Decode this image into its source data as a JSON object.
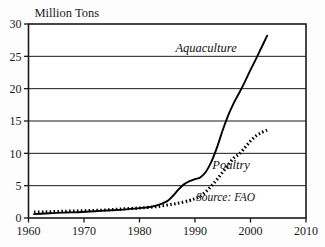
{
  "chart_data": {
    "type": "line",
    "title": "",
    "xlabel": "",
    "ylabel": "Million Tons",
    "xlim": [
      1960,
      2010
    ],
    "ylim": [
      0,
      30
    ],
    "xticks": [
      1960,
      1970,
      1980,
      1990,
      2000,
      2010
    ],
    "yticks": [
      0,
      5,
      10,
      15,
      20,
      25,
      30
    ],
    "grid": "horizontal",
    "legend_position": "inline-annotations",
    "annotations": [
      {
        "text": "Aquaculture",
        "x": 1992,
        "y": 25.6,
        "style": "italic"
      },
      {
        "text": "Poultry",
        "x": 1996.5,
        "y": 7.6,
        "style": "italic"
      },
      {
        "text": "Source: FAO",
        "x": 1995.5,
        "y": 2.6,
        "style": "italic"
      }
    ],
    "series": [
      {
        "name": "Aquaculture",
        "style": "solid",
        "color": "#000000",
        "x": [
          1961,
          1963,
          1965,
          1967,
          1969,
          1971,
          1973,
          1975,
          1977,
          1979,
          1981,
          1983,
          1985,
          1986,
          1987,
          1988,
          1989,
          1990,
          1991,
          1992,
          1993,
          1994,
          1995,
          1996,
          1997,
          1998,
          1999,
          2000,
          2001,
          2002,
          2003
        ],
        "values": [
          0.6,
          0.7,
          0.8,
          0.85,
          0.9,
          1.0,
          1.1,
          1.2,
          1.3,
          1.45,
          1.6,
          1.9,
          2.6,
          3.4,
          4.4,
          5.2,
          5.7,
          6.0,
          6.3,
          7.2,
          8.8,
          11.0,
          13.6,
          15.9,
          17.8,
          19.4,
          21.1,
          22.9,
          24.6,
          26.4,
          28.2
        ]
      },
      {
        "name": "Poultry",
        "style": "dotted",
        "color": "#000000",
        "x": [
          1961,
          1963,
          1965,
          1967,
          1969,
          1971,
          1973,
          1975,
          1977,
          1979,
          1981,
          1983,
          1985,
          1987,
          1989,
          1990,
          1991,
          1992,
          1993,
          1994,
          1995,
          1996,
          1997,
          1998,
          1999,
          2000,
          2001,
          2002,
          2003
        ],
        "values": [
          0.9,
          0.95,
          1.0,
          1.05,
          1.1,
          1.15,
          1.2,
          1.3,
          1.4,
          1.5,
          1.6,
          1.75,
          2.0,
          2.3,
          2.7,
          3.0,
          3.4,
          4.1,
          5.0,
          6.0,
          7.1,
          8.2,
          9.3,
          9.9,
          10.9,
          11.9,
          12.7,
          13.2,
          13.6
        ]
      }
    ]
  }
}
